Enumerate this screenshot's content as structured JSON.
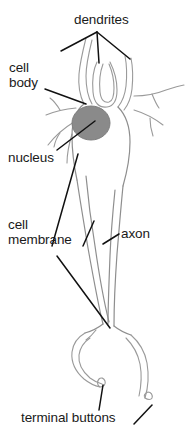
{
  "figure": {
    "background_color": "#ffffff",
    "width": 192,
    "height": 444
  },
  "labels": {
    "dendrites": "dendrites",
    "cell_body_line1": "cell",
    "cell_body_line2": "body",
    "nucleus": "nucleus",
    "cell_membrane_line1": "cell",
    "cell_membrane_line2": "membrane",
    "axon": "axon",
    "terminal_buttons": "terminal buttons"
  },
  "colors": {
    "text": "#1a1a1a",
    "leader_line": "#000000",
    "cell_outline": "#9a9a9a",
    "cell_outline_dark": "#7c7c7c",
    "nucleus_fill": "#8a8a8a",
    "nucleus_stroke": "#787878",
    "background": "#ffffff"
  },
  "parts": [
    {
      "name": "dendrites",
      "label": "dendrites",
      "leader_count": 3
    },
    {
      "name": "cell-body",
      "label": "cell body",
      "leader_count": 1
    },
    {
      "name": "nucleus",
      "label": "nucleus",
      "leader_count": 1
    },
    {
      "name": "cell-membrane",
      "label": "cell membrane",
      "leader_count": 3
    },
    {
      "name": "axon",
      "label": "axon",
      "leader_count": 1
    },
    {
      "name": "terminal-buttons",
      "label": "terminal buttons",
      "leader_count": 2
    }
  ]
}
